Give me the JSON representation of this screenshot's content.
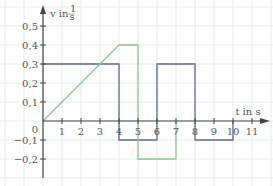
{
  "chart_data": {
    "type": "line",
    "title": "",
    "xlabel": "t in s",
    "ylabel": "v in m/s",
    "ylabel_display": "v in",
    "ylabel_unit_num": "1",
    "ylabel_unit_den": "s",
    "xlim": [
      -1,
      12
    ],
    "ylim": [
      -0.3,
      0.6
    ],
    "grid": true,
    "x_ticks": [
      1,
      2,
      3,
      4,
      5,
      6,
      7,
      8,
      9,
      10,
      11
    ],
    "x_tick_labels": [
      "1",
      "2",
      "3",
      "4",
      "5",
      "6",
      "7",
      "8",
      "9",
      "10",
      "11"
    ],
    "y_ticks": [
      0.5,
      0.4,
      0.3,
      0.2,
      0.1,
      -0.1,
      -0.2
    ],
    "y_tick_labels": [
      "0,5",
      "0,4",
      "0,3",
      "0,2",
      "0,1",
      "−0,1",
      "−0,2"
    ],
    "origin_label": "0",
    "series": [
      {
        "name": "blue",
        "color": "#5a6a9a",
        "points": [
          [
            0,
            0.3
          ],
          [
            4,
            0.3
          ],
          [
            4,
            -0.1
          ],
          [
            6,
            -0.1
          ],
          [
            6,
            0.3
          ],
          [
            8,
            0.3
          ],
          [
            8,
            -0.1
          ],
          [
            10,
            -0.1
          ],
          [
            10,
            0
          ]
        ]
      },
      {
        "name": "green",
        "color": "#8cc88c",
        "points": [
          [
            0,
            0
          ],
          [
            4,
            0.4
          ],
          [
            5,
            0.4
          ],
          [
            5,
            -0.2
          ],
          [
            7,
            -0.2
          ],
          [
            7,
            0
          ]
        ]
      }
    ]
  },
  "colors": {
    "grid": "#e6ecf0",
    "axis": "#444444",
    "blue": "#5a6a9a",
    "green": "#8cc88c"
  }
}
